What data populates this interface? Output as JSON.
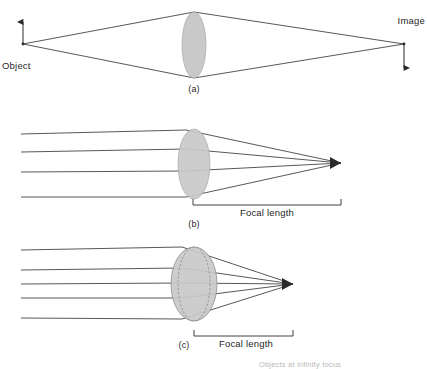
{
  "figure": {
    "kind": "optics-ray-diagram",
    "background_color": "#ffffff",
    "ray_color": "#3a3a3a",
    "lens_fill_color": "#c9c9c9",
    "lens_stroke_color": "#8f8f8f",
    "text_color": "#1f1f1f",
    "width": 427,
    "height": 369
  },
  "panel_a": {
    "letter": "(a)",
    "object_label": "Object",
    "image_label": "Image",
    "object_point": {
      "x": 23,
      "y": 44
    },
    "object_arrow_tip": {
      "x": 23,
      "y": 18
    },
    "image_point": {
      "x": 404,
      "y": 44
    },
    "image_arrow_tip": {
      "x": 404,
      "y": 74
    },
    "lens": {
      "cx": 194,
      "cy": 45,
      "rx": 12,
      "ry": 33
    },
    "ray_top_y": 12,
    "ray_bottom_y": 78
  },
  "panel_b": {
    "letter": "(b)",
    "focal_length_label": "Focal length",
    "lens": {
      "cx": 194,
      "cy": 164,
      "rx": 16,
      "ry": 35
    },
    "focal_point": {
      "x": 341,
      "y": 163
    },
    "ray_start_x": 21,
    "ray_heights": [
      134,
      152,
      172,
      197
    ],
    "bracket": {
      "x1": 193,
      "x2": 341,
      "y": 205,
      "tick": 6
    },
    "ray_count": 4
  },
  "panel_c": {
    "letter": "(c)",
    "focal_length_label": "Focal length",
    "lens": {
      "cx": 194,
      "cy": 284,
      "rx": 23,
      "ry": 37
    },
    "thin_lens_ghost": {
      "cx": 194,
      "cy": 284,
      "rx": 16,
      "ry": 37
    },
    "focal_point": {
      "x": 293,
      "y": 284
    },
    "ray_start_x": 21,
    "ray_heights": [
      250,
      270,
      284,
      298,
      318
    ],
    "bracket": {
      "x1": 194,
      "x2": 293,
      "y": 336,
      "tick": 6
    },
    "ray_count": 5
  },
  "bottom_caption": {
    "text": "Objects at infinity focus"
  }
}
